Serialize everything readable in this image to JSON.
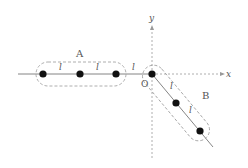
{
  "diagram": {
    "axes": {
      "x_label": "x",
      "y_label": "y",
      "origin_label": "O"
    },
    "groups": [
      {
        "name": "A",
        "label": "A",
        "orientation": "horizontal",
        "particle_count": 3
      },
      {
        "name": "B",
        "label": "B",
        "orientation": "diagonal-down-right",
        "particle_count": 3
      }
    ],
    "spacing_labels": {
      "a_1": "l",
      "a_2": "l",
      "gap_a_origin": "l",
      "b_1": "l",
      "b_2": "l"
    },
    "colors": {
      "line": "#777777",
      "dashed": "#999999",
      "dot": "#111111",
      "text": "#555555"
    }
  }
}
